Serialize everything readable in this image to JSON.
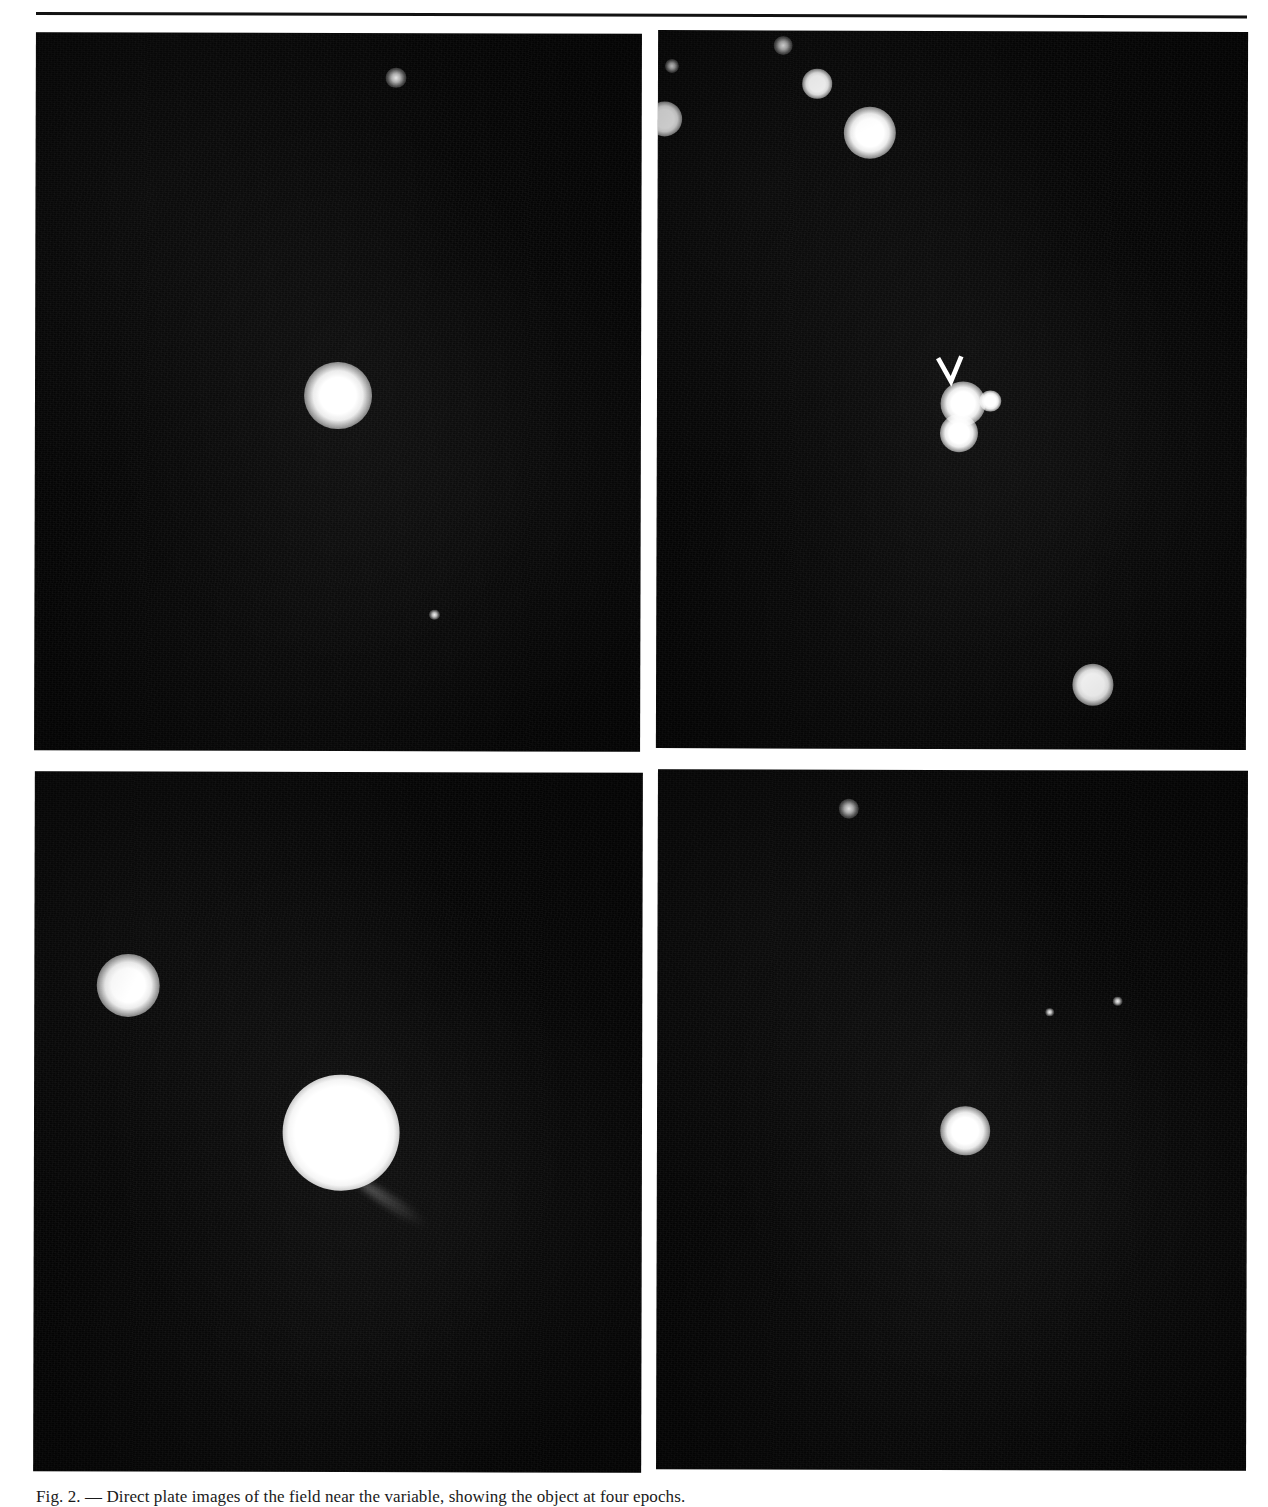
{
  "figure": {
    "kind": "photographic-plate-montage",
    "background_color": "#ffffff",
    "plate_color": "#050505",
    "star_color": "#ffffff",
    "rule_color": "#121212",
    "panel_count": 4,
    "caption_text": "Fig. 2. — Direct plate images of the field near the variable, showing the object at four epochs.",
    "panels": [
      {
        "id": "panel-tl",
        "position": "top-left",
        "label": "",
        "objects": [
          {
            "name": "primary-star",
            "cx": 50.0,
            "cy": 50.5,
            "r": 2.8,
            "kind": "star"
          },
          {
            "name": "faint-star-1",
            "cx": 59.4,
            "cy": 6.2,
            "r": 0.85,
            "kind": "faint"
          },
          {
            "name": "faint-star-2",
            "cx": 66.0,
            "cy": 81.0,
            "r": 0.45,
            "kind": "faint"
          }
        ]
      },
      {
        "id": "panel-tr",
        "position": "top-right",
        "label": "",
        "marker": {
          "name": "pointer-arrow",
          "glyph": "chevron-down",
          "cx": 49.8,
          "cy": 47.5
        },
        "objects": [
          {
            "name": "marked-star",
            "cx": 51.9,
            "cy": 51.9,
            "r": 1.9,
            "kind": "star"
          },
          {
            "name": "companion-star",
            "cx": 56.5,
            "cy": 51.5,
            "r": 0.9,
            "kind": "star"
          },
          {
            "name": "lower-star",
            "cx": 51.2,
            "cy": 56.0,
            "r": 1.6,
            "kind": "star"
          },
          {
            "name": "bright-star-n",
            "cx": 36.0,
            "cy": 14.2,
            "r": 2.2,
            "kind": "star"
          },
          {
            "name": "star-nw",
            "cx": 27.0,
            "cy": 7.4,
            "r": 1.25,
            "kind": "star"
          },
          {
            "name": "star-edge-w",
            "cx": 1.2,
            "cy": 12.4,
            "r": 1.5,
            "kind": "star"
          },
          {
            "name": "faint-star-nw",
            "cx": 21.2,
            "cy": 2.1,
            "r": 0.8,
            "kind": "faint"
          },
          {
            "name": "faint-star-n",
            "cx": 2.4,
            "cy": 5.0,
            "r": 0.6,
            "kind": "faint"
          },
          {
            "name": "star-se",
            "cx": 74.0,
            "cy": 91.0,
            "r": 1.75,
            "kind": "star"
          }
        ]
      },
      {
        "id": "panel-bl",
        "position": "bottom-left",
        "label": "",
        "objects": [
          {
            "name": "bright-saturated-object",
            "cx": 50.5,
            "cy": 51.5,
            "r": 4.8,
            "kind": "saturated"
          },
          {
            "name": "companion-star-nw",
            "cx": 15.5,
            "cy": 30.5,
            "r": 2.6,
            "kind": "star"
          }
        ],
        "tail": {
          "name": "diffuse-tail",
          "from_cx": 53.5,
          "from_cy": 57.5,
          "length": 13.5,
          "angle_deg": 33
        }
      },
      {
        "id": "panel-br",
        "position": "bottom-right",
        "label": "",
        "objects": [
          {
            "name": "primary-star",
            "cx": 52.2,
            "cy": 51.5,
            "r": 2.1,
            "kind": "star"
          },
          {
            "name": "faint-star-n",
            "cx": 32.3,
            "cy": 5.6,
            "r": 0.85,
            "kind": "faint"
          },
          {
            "name": "faint-star-e",
            "cx": 78.0,
            "cy": 33.0,
            "r": 0.4,
            "kind": "faint"
          },
          {
            "name": "faint-streak",
            "cx": 66.5,
            "cy": 34.5,
            "r": 0.35,
            "kind": "faint"
          }
        ]
      }
    ]
  }
}
